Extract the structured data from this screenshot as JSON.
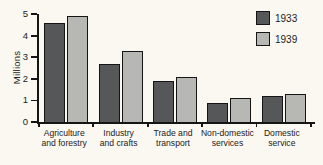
{
  "figure": {
    "background": "#faf8f1",
    "axis_color": "#151515"
  },
  "chart_data": {
    "type": "bar",
    "title": "",
    "xlabel": "",
    "ylabel": "Millions",
    "ylim": [
      0,
      5
    ],
    "yticks": [
      0,
      1,
      2,
      3,
      4,
      5
    ],
    "grid": false,
    "legend_position": "top-right",
    "categories": [
      "Agriculture and forestry",
      "Industry and crafts",
      "Trade and transport",
      "Non-domestic services",
      "Domestic service"
    ],
    "category_label_lines": [
      [
        "Agriculture",
        "and forestry"
      ],
      [
        "Industry",
        "and crafts"
      ],
      [
        "Trade and",
        "transport"
      ],
      [
        "Non-domestic",
        "services"
      ],
      [
        "Domestic",
        "service"
      ]
    ],
    "series": [
      {
        "name": "1933",
        "color": "#565759",
        "values": [
          4.6,
          2.7,
          1.9,
          0.9,
          1.2
        ]
      },
      {
        "name": "1939",
        "color": "#b7b8b4",
        "values": [
          4.9,
          3.3,
          2.1,
          1.1,
          1.3
        ]
      }
    ]
  }
}
